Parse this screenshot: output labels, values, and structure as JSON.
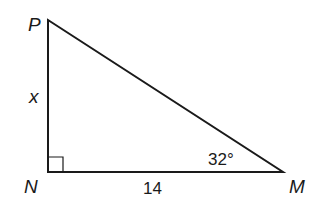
{
  "diagram": {
    "type": "right-triangle",
    "vertices": {
      "P": {
        "label": "P",
        "x": 48,
        "y": 20
      },
      "N": {
        "label": "N",
        "x": 48,
        "y": 172
      },
      "M": {
        "label": "M",
        "x": 283,
        "y": 172
      }
    },
    "sides": {
      "PN": {
        "label": "x"
      },
      "NM": {
        "label": "14"
      }
    },
    "angles": {
      "M": {
        "label": "32°"
      },
      "N": {
        "right_angle": true
      }
    },
    "stroke_color": "#1a1a1a",
    "background": "#ffffff"
  }
}
